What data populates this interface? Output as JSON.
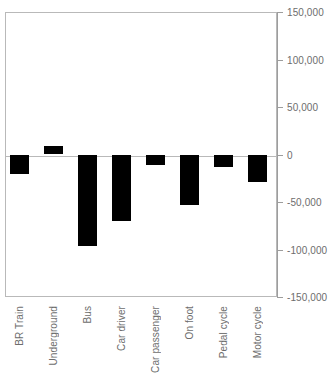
{
  "chart_data": {
    "type": "bar",
    "title": "",
    "xlabel": "",
    "ylabel": "",
    "categories": [
      "BR Train",
      "Underground",
      "Bus",
      "Car driver",
      "Car passenger",
      "On foot",
      "Pedal cycle",
      "Motor cycle"
    ],
    "values": [
      -21000,
      9000,
      -96000,
      -70000,
      -11000,
      -53000,
      -13000,
      -29000
    ],
    "ylim": [
      -150000,
      150000
    ],
    "yticks": [
      150000,
      100000,
      50000,
      0,
      -50000,
      -100000,
      -150000
    ],
    "ytick_labels": [
      "150,000",
      "100,000",
      "50,000",
      "0",
      "-50,000",
      "-100,000",
      "-150,000"
    ],
    "grid": false,
    "legend": false,
    "axis_position": "right",
    "bar_color": "#000000",
    "axis_color": "#b9b9b9",
    "text_color": "#6d6d6d"
  }
}
